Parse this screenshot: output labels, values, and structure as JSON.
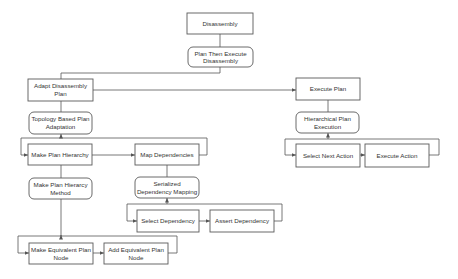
{
  "diagram": {
    "type": "hierarchical task decomposition",
    "nodes": {
      "disassembly": {
        "line1": "Disassembly",
        "shape": "rectangle"
      },
      "plan_then_execute": {
        "line1": "Plan Then Execute",
        "line2": "Disassembly",
        "shape": "rounded"
      },
      "adapt_plan": {
        "line1": "Adapt Disassembly",
        "line2": "Plan",
        "shape": "rectangle"
      },
      "topology_adaptation": {
        "line1": "Topology Based Plan",
        "line2": "Adaptation",
        "shape": "rounded"
      },
      "make_plan_hierarchy": {
        "line1": "Make Plan Hierarchy",
        "shape": "rectangle"
      },
      "map_dependencies": {
        "line1": "Map Dependencies",
        "shape": "rectangle"
      },
      "make_plan_hierarcy_method": {
        "line1": "Make Plan Hierarcy",
        "line2": "Method",
        "shape": "rounded"
      },
      "serialized_dependency_mapping": {
        "line1": "Serialized",
        "line2": "Dependency Mapping",
        "shape": "rounded"
      },
      "select_dependency": {
        "line1": "Select Dependency",
        "shape": "rectangle"
      },
      "assert_dependency": {
        "line1": "Assert Dependency",
        "shape": "rectangle"
      },
      "make_equivalent_plan_node": {
        "line1": "Make Equivalent Plan",
        "line2": "Node",
        "shape": "rectangle"
      },
      "add_equivalent_plan_node": {
        "line1": "Add Equivalent Plan",
        "line2": "Node",
        "shape": "rectangle"
      },
      "execute_plan": {
        "line1": "Execute Plan",
        "shape": "rectangle"
      },
      "hierarchical_plan_execution": {
        "line1": "Hierarchical Plan",
        "line2": "Execution",
        "shape": "rounded"
      },
      "select_next_action": {
        "line1": "Select Next Action",
        "shape": "rectangle"
      },
      "execute_action": {
        "line1": "Execute Action",
        "shape": "rectangle"
      }
    },
    "edges": [
      {
        "from": "disassembly",
        "to": "plan_then_execute"
      },
      {
        "from": "plan_then_execute",
        "to": "adapt_plan"
      },
      {
        "from": "adapt_plan",
        "to": "execute_plan",
        "arrow": true
      },
      {
        "from": "adapt_plan",
        "to": "topology_adaptation"
      },
      {
        "from": "topology_adaptation",
        "to": "make_plan_hierarchy"
      },
      {
        "from": "make_plan_hierarchy",
        "to": "map_dependencies",
        "arrow": true
      },
      {
        "from": "map_dependencies",
        "to": "make_plan_hierarchy",
        "loop": true
      },
      {
        "from": "make_plan_hierarchy",
        "to": "make_plan_hierarcy_method"
      },
      {
        "from": "map_dependencies",
        "to": "serialized_dependency_mapping"
      },
      {
        "from": "serialized_dependency_mapping",
        "to": "select_dependency"
      },
      {
        "from": "select_dependency",
        "to": "assert_dependency",
        "arrow": true
      },
      {
        "from": "assert_dependency",
        "to": "select_dependency",
        "loop": true
      },
      {
        "from": "make_plan_hierarcy_method",
        "to": "make_equivalent_plan_node"
      },
      {
        "from": "make_equivalent_plan_node",
        "to": "add_equivalent_plan_node",
        "arrow": true
      },
      {
        "from": "add_equivalent_plan_node",
        "to": "make_equivalent_plan_node",
        "loop": true
      },
      {
        "from": "execute_plan",
        "to": "hierarchical_plan_execution"
      },
      {
        "from": "hierarchical_plan_execution",
        "to": "select_next_action"
      },
      {
        "from": "select_next_action",
        "to": "execute_action",
        "arrow": true
      },
      {
        "from": "execute_action",
        "to": "select_next_action",
        "loop": true
      }
    ],
    "colors": {
      "line": "#555555",
      "text": "#333333",
      "background": "#ffffff"
    }
  }
}
